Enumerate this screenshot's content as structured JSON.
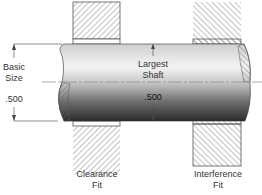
{
  "diagram": {
    "left_dimension": {
      "line1": "Basic",
      "line2": "Size",
      "value": ".500"
    },
    "shaft": {
      "label_line1": "Largest",
      "label_line2": "Shaft",
      "value": ".500"
    },
    "fits": [
      {
        "line1": "Clearance",
        "line2": "Fit"
      },
      {
        "line1": "Interference",
        "line2": "Fit"
      }
    ],
    "colors": {
      "hatch": "#555555",
      "shaft_light": "#f2f2f2",
      "shaft_dark": "#2a2a2a",
      "line": "#444444"
    }
  }
}
